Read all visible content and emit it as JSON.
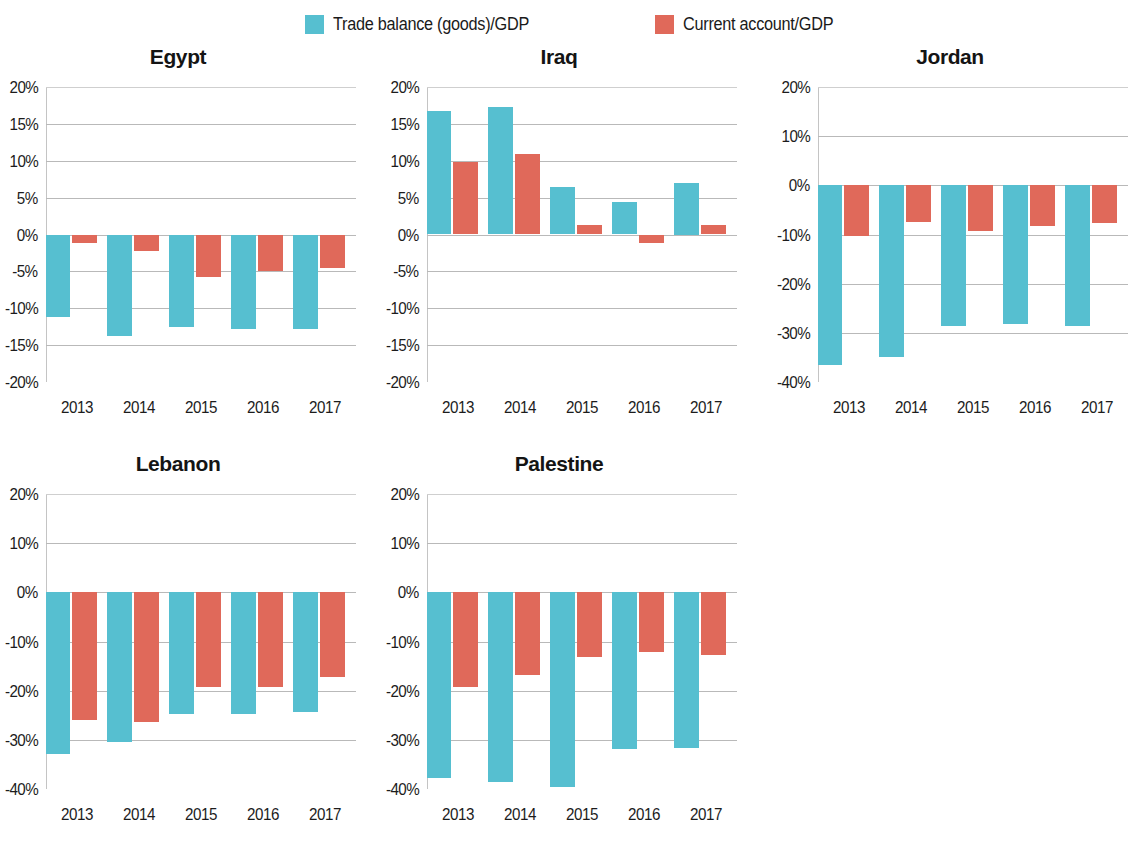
{
  "legend": {
    "items": [
      {
        "label": "Trade balance (goods)/GDP",
        "color": "#56bfd0",
        "x": 305
      },
      {
        "label": "Current account/GDP",
        "color": "#e0695a",
        "x": 655
      }
    ]
  },
  "chart_data": [
    {
      "type": "bar",
      "title": "Egypt",
      "xlabel": "",
      "ylabel": "",
      "categories": [
        "2013",
        "2014",
        "2015",
        "2016",
        "2017"
      ],
      "ylim": [
        -20,
        20
      ],
      "yticks": [
        20,
        15,
        10,
        5,
        0,
        -5,
        -10,
        -15,
        -20
      ],
      "yticklabels": [
        "20%",
        "15%",
        "10%",
        "5%",
        "0%",
        "-5%",
        "-10%",
        "-15%",
        "-20%"
      ],
      "grid": true,
      "series": [
        {
          "name": "Trade balance (goods)/GDP",
          "color": "#56bfd0",
          "values": [
            -11.2,
            -13.8,
            -12.6,
            -12.8,
            -12.8
          ]
        },
        {
          "name": "Current account/GDP",
          "color": "#e0695a",
          "values": [
            -1.2,
            -2.2,
            -5.7,
            -5.0,
            -4.5
          ]
        }
      ]
    },
    {
      "type": "bar",
      "title": "Iraq",
      "xlabel": "",
      "ylabel": "",
      "categories": [
        "2013",
        "2014",
        "2015",
        "2016",
        "2017"
      ],
      "ylim": [
        -20,
        20
      ],
      "yticks": [
        20,
        15,
        10,
        5,
        0,
        -5,
        -10,
        -15,
        -20
      ],
      "yticklabels": [
        "20%",
        "15%",
        "10%",
        "5%",
        "0%",
        "-5%",
        "-10%",
        "-15%",
        "-20%"
      ],
      "grid": true,
      "series": [
        {
          "name": "Trade balance (goods)/GDP",
          "color": "#56bfd0",
          "values": [
            16.8,
            17.3,
            6.4,
            4.4,
            7.0
          ]
        },
        {
          "name": "Current account/GDP",
          "color": "#e0695a",
          "values": [
            9.8,
            10.9,
            1.3,
            -1.2,
            1.3
          ]
        }
      ]
    },
    {
      "type": "bar",
      "title": "Jordan",
      "xlabel": "",
      "ylabel": "",
      "categories": [
        "2013",
        "2014",
        "2015",
        "2016",
        "2017"
      ],
      "ylim": [
        -40,
        20
      ],
      "yticks": [
        20,
        10,
        0,
        -10,
        -20,
        -30,
        -40
      ],
      "yticklabels": [
        "20%",
        "10%",
        "0%",
        "-10%",
        "-20%",
        "-30%",
        "-40%"
      ],
      "grid": true,
      "series": [
        {
          "name": "Trade balance (goods)/GDP",
          "color": "#56bfd0",
          "values": [
            -36.5,
            -35.0,
            -28.6,
            -28.3,
            -28.6
          ]
        },
        {
          "name": "Current account/GDP",
          "color": "#e0695a",
          "values": [
            -10.4,
            -7.4,
            -9.2,
            -8.2,
            -7.7
          ]
        }
      ]
    },
    {
      "type": "bar",
      "title": "Lebanon",
      "xlabel": "",
      "ylabel": "",
      "categories": [
        "2013",
        "2014",
        "2015",
        "2016",
        "2017"
      ],
      "ylim": [
        -40,
        20
      ],
      "yticks": [
        20,
        10,
        0,
        -10,
        -20,
        -30,
        -40
      ],
      "yticklabels": [
        "20%",
        "10%",
        "0%",
        "-10%",
        "-20%",
        "-30%",
        "-40%"
      ],
      "grid": true,
      "series": [
        {
          "name": "Trade balance (goods)/GDP",
          "color": "#56bfd0",
          "values": [
            -32.8,
            -30.5,
            -24.8,
            -24.8,
            -24.3
          ]
        },
        {
          "name": "Current account/GDP",
          "color": "#e0695a",
          "values": [
            -26.0,
            -26.3,
            -19.2,
            -19.2,
            -17.3
          ]
        }
      ]
    },
    {
      "type": "bar",
      "title": "Palestine",
      "xlabel": "",
      "ylabel": "",
      "categories": [
        "2013",
        "2014",
        "2015",
        "2016",
        "2017"
      ],
      "ylim": [
        -40,
        20
      ],
      "yticks": [
        20,
        10,
        0,
        -10,
        -20,
        -30,
        -40
      ],
      "yticklabels": [
        "20%",
        "10%",
        "0%",
        "-10%",
        "-20%",
        "-30%",
        "-40%"
      ],
      "grid": true,
      "series": [
        {
          "name": "Trade balance (goods)/GDP",
          "color": "#56bfd0",
          "values": [
            -37.8,
            -38.5,
            -39.5,
            -31.8,
            -31.7
          ]
        },
        {
          "name": "Current account/GDP",
          "color": "#e0695a",
          "values": [
            -19.3,
            -16.8,
            -13.2,
            -12.2,
            -12.8
          ]
        }
      ]
    }
  ],
  "layout": {
    "panels": [
      {
        "key": "egypt",
        "left": 0,
        "top": 45,
        "width": 374,
        "height": 395,
        "plot_left": 46,
        "plot_top": 42,
        "plot_width": 310,
        "plot_height": 295,
        "clip_right": false
      },
      {
        "key": "iraq",
        "left": 381,
        "top": 45,
        "width": 374,
        "height": 395,
        "plot_left": 46,
        "plot_top": 42,
        "plot_width": 310,
        "plot_height": 295,
        "clip_right": false
      },
      {
        "key": "jordan",
        "left": 772,
        "top": 45,
        "width": 374,
        "height": 395,
        "plot_left": 46,
        "plot_top": 42,
        "plot_width": 310,
        "plot_height": 295,
        "clip_right": true
      },
      {
        "key": "lebanon",
        "left": 0,
        "top": 452,
        "width": 374,
        "height": 395,
        "plot_left": 46,
        "plot_top": 42,
        "plot_width": 310,
        "plot_height": 295,
        "clip_right": false
      },
      {
        "key": "palestine",
        "left": 381,
        "top": 452,
        "width": 374,
        "height": 395,
        "plot_left": 46,
        "plot_top": 42,
        "plot_width": 310,
        "plot_height": 295,
        "clip_right": false
      }
    ]
  }
}
